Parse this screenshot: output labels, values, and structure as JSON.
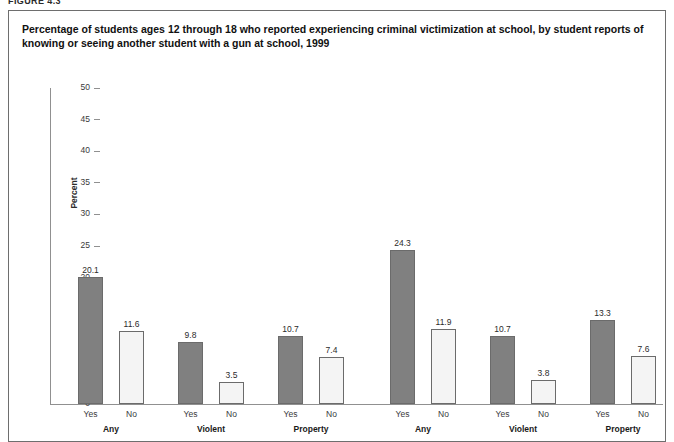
{
  "figure": {
    "number_label": "FIGURE 4.3",
    "title": "Percentage of students ages 12 through 18 who reported experiencing criminal victimization at school, by student reports of knowing or seeing another student with a gun at school, 1999"
  },
  "chart_data": {
    "type": "bar",
    "title": "Percentage of students ages 12 through 18 who reported experiencing criminal victimization at school, by student reports of knowing or seeing another student with a gun at school, 1999",
    "xlabel": "",
    "ylabel": "Percent",
    "ylim": [
      0,
      50
    ],
    "ytick_step": 5,
    "yticks": [
      "50",
      "45",
      "40",
      "35",
      "30",
      "25",
      "20",
      "15",
      "10",
      "5",
      "0"
    ],
    "grid": false,
    "legend": "none",
    "panels": [
      {
        "name": "panel-1",
        "groups": [
          {
            "label": "Any",
            "bars": [
              {
                "label": "Yes",
                "value": 20.1,
                "value_label": "20.1",
                "style": "filled"
              },
              {
                "label": "No",
                "value": 11.6,
                "value_label": "11.6",
                "style": "open"
              }
            ]
          },
          {
            "label": "Violent",
            "bars": [
              {
                "label": "Yes",
                "value": 9.8,
                "value_label": "9.8",
                "style": "filled"
              },
              {
                "label": "No",
                "value": 3.5,
                "value_label": "3.5",
                "style": "open"
              }
            ]
          },
          {
            "label": "Property",
            "bars": [
              {
                "label": "Yes",
                "value": 10.7,
                "value_label": "10.7",
                "style": "filled"
              },
              {
                "label": "No",
                "value": 7.4,
                "value_label": "7.4",
                "style": "open"
              }
            ]
          }
        ]
      },
      {
        "name": "panel-2",
        "groups": [
          {
            "label": "Any",
            "bars": [
              {
                "label": "Yes",
                "value": 24.3,
                "value_label": "24.3",
                "style": "filled"
              },
              {
                "label": "No",
                "value": 11.9,
                "value_label": "11.9",
                "style": "open"
              }
            ]
          },
          {
            "label": "Violent",
            "bars": [
              {
                "label": "Yes",
                "value": 10.7,
                "value_label": "10.7",
                "style": "filled"
              },
              {
                "label": "No",
                "value": 3.8,
                "value_label": "3.8",
                "style": "open"
              }
            ]
          },
          {
            "label": "Property",
            "bars": [
              {
                "label": "Yes",
                "value": 13.3,
                "value_label": "13.3",
                "style": "filled"
              },
              {
                "label": "No",
                "value": 7.6,
                "value_label": "7.6",
                "style": "open"
              }
            ]
          }
        ]
      }
    ]
  },
  "colors": {
    "bar_filled": "#808080",
    "bar_open": "#f4f4f4",
    "bar_border": "#6b6b6b",
    "axis": "#909090",
    "frame": "#6e6e6e",
    "text": "#1a1a1a"
  }
}
